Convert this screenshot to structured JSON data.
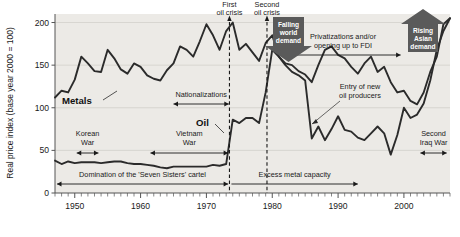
{
  "chart_data": {
    "type": "line",
    "title": "",
    "xlabel": "",
    "ylabel": "Real price index (base year 2000 = 100)",
    "ylim": [
      0,
      210
    ],
    "xlim": [
      1947,
      2007
    ],
    "yticks": [
      0,
      50,
      100,
      150,
      200
    ],
    "ytick_labels": [
      "0",
      "50",
      "100",
      "150",
      "200"
    ],
    "xticks": [
      1950,
      1960,
      1970,
      1980,
      1990,
      2000
    ],
    "xtick_labels": [
      "1950",
      "1960",
      "1970",
      "1980",
      "1990",
      "2000"
    ],
    "minor_xtick_interval": 1,
    "grid": true,
    "legend_position": "inline-labels",
    "plot_background": "#eceae6",
    "series": [
      {
        "name": "Metals",
        "color": "#2b2b2b",
        "x": [
          1947,
          1948,
          1949,
          1950,
          1951,
          1952,
          1953,
          1954,
          1955,
          1956,
          1957,
          1958,
          1959,
          1960,
          1961,
          1962,
          1963,
          1964,
          1965,
          1966,
          1967,
          1968,
          1969,
          1970,
          1971,
          1972,
          1973,
          1974,
          1975,
          1976,
          1977,
          1978,
          1979,
          1980,
          1981,
          1982,
          1983,
          1984,
          1985,
          1986,
          1987,
          1988,
          1989,
          1990,
          1991,
          1992,
          1993,
          1994,
          1995,
          1996,
          1997,
          1998,
          1999,
          2000,
          2001,
          2002,
          2003,
          2004,
          2005,
          2006,
          2007
        ],
        "values": [
          112,
          120,
          118,
          133,
          160,
          152,
          143,
          142,
          168,
          158,
          145,
          140,
          152,
          148,
          138,
          134,
          132,
          144,
          152,
          172,
          168,
          160,
          178,
          198,
          185,
          168,
          190,
          200,
          168,
          175,
          165,
          155,
          176,
          185,
          160,
          152,
          150,
          143,
          139,
          130,
          150,
          168,
          172,
          162,
          158,
          148,
          140,
          152,
          160,
          142,
          148,
          130,
          118,
          120,
          108,
          104,
          118,
          142,
          160,
          198,
          205
        ]
      },
      {
        "name": "Oil",
        "color": "#2b2b2b",
        "x": [
          1947,
          1948,
          1949,
          1950,
          1951,
          1952,
          1953,
          1954,
          1955,
          1956,
          1957,
          1958,
          1959,
          1960,
          1961,
          1962,
          1963,
          1964,
          1965,
          1966,
          1967,
          1968,
          1969,
          1970,
          1971,
          1972,
          1973,
          1974,
          1975,
          1976,
          1977,
          1978,
          1979,
          1980,
          1981,
          1982,
          1983,
          1984,
          1985,
          1986,
          1987,
          1988,
          1989,
          1990,
          1991,
          1992,
          1993,
          1994,
          1995,
          1996,
          1997,
          1998,
          1999,
          2000,
          2001,
          2002,
          2003,
          2004,
          2005,
          2006,
          2007
        ],
        "values": [
          38,
          34,
          37,
          35,
          36,
          36,
          36,
          35,
          36,
          37,
          37,
          35,
          34,
          34,
          33,
          32,
          30,
          29,
          31,
          31,
          31,
          31,
          31,
          31,
          33,
          32,
          34,
          86,
          82,
          88,
          88,
          82,
          118,
          168,
          160,
          150,
          142,
          138,
          132,
          64,
          78,
          62,
          75,
          90,
          74,
          72,
          65,
          62,
          70,
          78,
          70,
          45,
          68,
          100,
          88,
          92,
          105,
          132,
          168,
          190,
          205
        ]
      }
    ],
    "series_labels": [
      {
        "name": "Metals",
        "text": "Metals"
      },
      {
        "name": "Oil",
        "text": "Oil"
      }
    ],
    "event_lines": [
      {
        "name": "first-oil-crisis",
        "label": "First\noil crisis",
        "label_line_1": "First",
        "label_line_2": "oil crisis",
        "x": 1973.5
      },
      {
        "name": "second-oil-crisis",
        "label": "Second\noil crisis",
        "label_line_1": "Second",
        "label_line_2": "oil crisis",
        "x": 1979.2
      }
    ],
    "span_annotations": [
      {
        "name": "korean-war",
        "label_line_1": "Korean",
        "label_line_2": "War",
        "x_start": 1950.3,
        "x_end": 1953.6,
        "arrows": "both"
      },
      {
        "name": "vietnam-war",
        "label_line_1": "Vietnam",
        "label_line_2": "War",
        "x_start": 1961.5,
        "x_end": 1973.3,
        "arrows": "both"
      },
      {
        "name": "nationalizations",
        "label_line_1": "Nationalizations",
        "label_line_2": "",
        "x_start": 1965.0,
        "x_end": 1973.4,
        "arrows": "both"
      },
      {
        "name": "seven-sisters-cartel",
        "label_line_1": "Domination of the 'Seven Sisters' cartel",
        "label_line_2": "",
        "x_start": 1947.3,
        "x_end": 1973.3,
        "arrows": "both"
      },
      {
        "name": "excess-metal-capacity",
        "label_line_1": "Excess metal capacity",
        "label_line_2": "",
        "x_start": 1973.8,
        "x_end": 1993.0,
        "arrows": "right"
      },
      {
        "name": "privatizations-fdi",
        "label_line_1": "Privatizations and/or",
        "label_line_2": "opening up to FDI",
        "x_start": 1982.0,
        "x_end": 1999.5,
        "arrows": "both"
      },
      {
        "name": "second-iraq-war",
        "label_line_1": "Second",
        "label_line_2": "Iraq War",
        "x_start": 2002.5,
        "x_end": 2006.5,
        "arrows": "both"
      }
    ],
    "callout_annotations": [
      {
        "name": "entry-of-new-oil-producers",
        "label_line_1": "Entry of new",
        "label_line_2": "oil producers"
      }
    ],
    "banners": [
      {
        "name": "falling-world-demand",
        "line_1": "Falling",
        "line_2": "world",
        "line_3": "demand",
        "direction": "down",
        "color": "#5a5a5a"
      },
      {
        "name": "rising-asian-demand",
        "line_1": "Rising",
        "line_2": "Asian",
        "line_3": "demand",
        "direction": "up",
        "color": "#5a5a5a"
      }
    ]
  },
  "colors": {
    "plot_bg": "#eceae6",
    "line": "#2b2b2b",
    "text": "#1a1a1a",
    "banner": "#5a5a5a",
    "grid": "#d2cfca",
    "axis": "#555555"
  }
}
